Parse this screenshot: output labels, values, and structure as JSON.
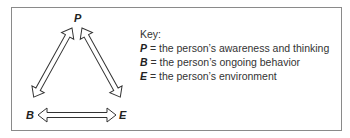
{
  "diagram": {
    "nodes": {
      "p": "P",
      "b": "B",
      "e": "E"
    },
    "key": {
      "title": "Key:",
      "items": [
        {
          "symbol": "P",
          "text": " = the person’s awareness and thinking"
        },
        {
          "symbol": "B",
          "text": " = the person’s ongoing behavior"
        },
        {
          "symbol": "E",
          "text": " = the person’s environment"
        }
      ]
    }
  }
}
